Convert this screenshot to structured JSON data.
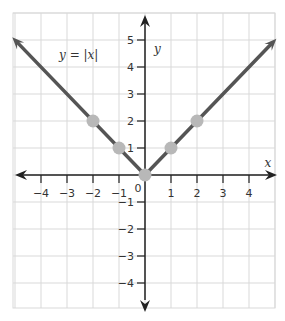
{
  "chart_data": {
    "type": "line",
    "title": "",
    "xlabel": "x",
    "ylabel": "y",
    "xlim": [
      -5,
      5
    ],
    "ylim": [
      -5,
      5.5
    ],
    "grid": true,
    "annotation": "y = |x|",
    "x_ticks": [
      "−4",
      "−3",
      "−2",
      "−1",
      "1",
      "2",
      "3",
      "4"
    ],
    "y_ticks": [
      "5",
      "4",
      "3",
      "2",
      "1",
      "−1",
      "−2",
      "−3",
      "−4"
    ],
    "origin_label": "0",
    "series": [
      {
        "name": "y = |x|",
        "x": [
          -5,
          0,
          5
        ],
        "y": [
          5,
          0,
          5
        ],
        "arrows": true,
        "color": "#555555"
      }
    ],
    "points": {
      "x": [
        -2,
        -1,
        0,
        1,
        2
      ],
      "y": [
        2,
        1,
        0,
        1,
        2
      ],
      "color": "#b8b8b8"
    }
  },
  "colors": {
    "grid": "#d9d9d9",
    "axis": "#222222",
    "line": "#555555",
    "point": "#b8b8b8"
  }
}
